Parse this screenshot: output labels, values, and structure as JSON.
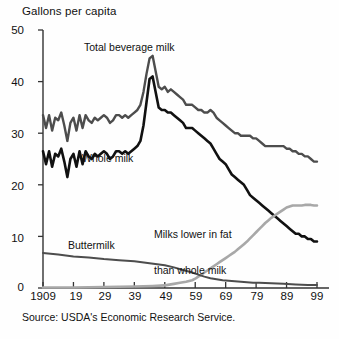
{
  "chart_data": {
    "type": "line",
    "title": "",
    "ylabel": "Gallons per capita",
    "xlabel": "",
    "ylim": [
      0,
      50
    ],
    "xlim": [
      1909,
      1999
    ],
    "yticks": [
      0,
      10,
      20,
      30,
      40,
      50
    ],
    "xticks": [
      1909,
      1919,
      1929,
      1939,
      1949,
      1959,
      1969,
      1979,
      1989,
      1999
    ],
    "xtick_labels": [
      "1909",
      "19",
      "29",
      "39",
      "49",
      "59",
      "69",
      "79",
      "89",
      "99"
    ],
    "grid": false,
    "legend": "inline-annotations",
    "source": "Source:  USDA's Economic Research Service.",
    "annotations": [
      {
        "text": "Total beverage milk",
        "series": "total_beverage_milk"
      },
      {
        "text": "Whole milk",
        "series": "whole_milk"
      },
      {
        "text": "Buttermilk",
        "series": "buttermilk"
      },
      {
        "text": "Milks lower in fat\nthan whole milk",
        "series": "lower_fat_milk"
      }
    ],
    "series": [
      {
        "name": "Total beverage milk",
        "color": "#4d4d4d",
        "x": [
          1909,
          1910,
          1911,
          1912,
          1913,
          1914,
          1915,
          1916,
          1917,
          1918,
          1919,
          1920,
          1921,
          1922,
          1923,
          1924,
          1925,
          1926,
          1927,
          1928,
          1929,
          1930,
          1931,
          1932,
          1933,
          1934,
          1935,
          1936,
          1937,
          1938,
          1939,
          1940,
          1941,
          1942,
          1943,
          1944,
          1945,
          1946,
          1947,
          1948,
          1949,
          1950,
          1951,
          1952,
          1953,
          1954,
          1955,
          1956,
          1957,
          1958,
          1959,
          1960,
          1961,
          1962,
          1963,
          1964,
          1965,
          1966,
          1967,
          1968,
          1969,
          1970,
          1971,
          1972,
          1973,
          1974,
          1975,
          1976,
          1977,
          1978,
          1979,
          1980,
          1981,
          1982,
          1983,
          1984,
          1985,
          1986,
          1987,
          1988,
          1989,
          1990,
          1991,
          1992,
          1993,
          1994,
          1995,
          1996,
          1997,
          1998,
          1999
        ],
        "values": [
          33.5,
          31.0,
          33.5,
          30.5,
          33.0,
          32.5,
          34.0,
          31.5,
          28.5,
          32.0,
          33.0,
          30.5,
          33.5,
          31.0,
          33.5,
          32.5,
          32.0,
          33.0,
          32.5,
          33.0,
          33.5,
          33.0,
          32.0,
          32.5,
          33.5,
          33.5,
          33.0,
          33.5,
          33.0,
          33.5,
          34.0,
          34.5,
          35.5,
          38.0,
          41.5,
          44.5,
          45.0,
          42.0,
          39.0,
          38.5,
          39.0,
          38.0,
          38.5,
          38.0,
          37.5,
          37.0,
          36.5,
          35.5,
          35.5,
          35.5,
          35.0,
          34.5,
          34.5,
          34.0,
          34.0,
          34.5,
          34.0,
          33.0,
          32.5,
          32.0,
          31.5,
          31.0,
          30.5,
          30.0,
          30.0,
          29.5,
          29.5,
          29.5,
          29.5,
          29.0,
          29.0,
          28.5,
          28.0,
          27.5,
          27.5,
          27.5,
          27.5,
          27.5,
          27.5,
          27.5,
          27.0,
          27.0,
          26.5,
          26.5,
          26.0,
          26.0,
          25.5,
          25.5,
          25.0,
          24.5,
          24.5
        ]
      },
      {
        "name": "Whole milk",
        "color": "#111111",
        "x": [
          1909,
          1910,
          1911,
          1912,
          1913,
          1914,
          1915,
          1916,
          1917,
          1918,
          1919,
          1920,
          1921,
          1922,
          1923,
          1924,
          1925,
          1926,
          1927,
          1928,
          1929,
          1930,
          1931,
          1932,
          1933,
          1934,
          1935,
          1936,
          1937,
          1938,
          1939,
          1940,
          1941,
          1942,
          1943,
          1944,
          1945,
          1946,
          1947,
          1948,
          1949,
          1950,
          1951,
          1952,
          1953,
          1954,
          1955,
          1956,
          1957,
          1958,
          1959,
          1960,
          1961,
          1962,
          1963,
          1964,
          1965,
          1966,
          1967,
          1968,
          1969,
          1970,
          1971,
          1972,
          1973,
          1974,
          1975,
          1976,
          1977,
          1978,
          1979,
          1980,
          1981,
          1982,
          1983,
          1984,
          1985,
          1986,
          1987,
          1988,
          1989,
          1990,
          1991,
          1992,
          1993,
          1994,
          1995,
          1996,
          1997,
          1998,
          1999
        ],
        "values": [
          26.5,
          24.0,
          26.5,
          23.5,
          26.0,
          25.5,
          27.0,
          24.5,
          21.5,
          25.0,
          26.0,
          23.5,
          26.5,
          24.0,
          26.5,
          25.5,
          25.0,
          26.0,
          25.5,
          26.0,
          26.5,
          26.0,
          25.0,
          25.5,
          26.5,
          26.5,
          26.0,
          26.5,
          26.0,
          26.5,
          27.0,
          27.5,
          28.5,
          31.5,
          36.0,
          40.5,
          41.0,
          38.0,
          35.0,
          34.5,
          34.5,
          34.0,
          34.0,
          33.5,
          33.0,
          32.5,
          32.0,
          31.0,
          31.0,
          31.0,
          30.5,
          30.0,
          29.5,
          29.0,
          28.5,
          28.0,
          27.0,
          26.0,
          25.0,
          24.5,
          24.0,
          23.0,
          22.0,
          21.5,
          21.0,
          20.5,
          20.0,
          19.0,
          18.0,
          17.5,
          17.0,
          16.5,
          16.0,
          15.5,
          15.0,
          14.5,
          14.0,
          13.5,
          13.0,
          12.5,
          12.0,
          11.5,
          11.0,
          10.5,
          10.5,
          10.0,
          10.0,
          9.5,
          9.5,
          9.0,
          9.0
        ]
      },
      {
        "name": "Milks lower in fat than whole milk",
        "color": "#a8a8a8",
        "x": [
          1909,
          1919,
          1929,
          1939,
          1945,
          1949,
          1950,
          1952,
          1954,
          1956,
          1958,
          1959,
          1960,
          1961,
          1962,
          1963,
          1964,
          1965,
          1966,
          1967,
          1968,
          1969,
          1970,
          1971,
          1972,
          1973,
          1974,
          1975,
          1976,
          1977,
          1978,
          1979,
          1980,
          1981,
          1982,
          1983,
          1984,
          1985,
          1986,
          1987,
          1988,
          1989,
          1990,
          1991,
          1992,
          1993,
          1994,
          1995,
          1996,
          1997,
          1998,
          1999
        ],
        "values": [
          0.1,
          0.1,
          0.2,
          0.3,
          0.4,
          0.5,
          0.6,
          0.8,
          1.0,
          1.2,
          1.5,
          1.8,
          2.2,
          2.6,
          3.0,
          3.4,
          3.8,
          4.2,
          4.6,
          5.0,
          5.4,
          5.8,
          6.2,
          6.6,
          7.0,
          7.5,
          8.0,
          8.5,
          9.0,
          9.6,
          10.2,
          10.8,
          11.4,
          12.0,
          12.6,
          13.1,
          13.6,
          14.0,
          14.4,
          14.8,
          15.2,
          15.6,
          15.8,
          16.0,
          16.0,
          16.0,
          16.0,
          16.1,
          16.1,
          16.1,
          16.0,
          16.0
        ]
      },
      {
        "name": "Buttermilk",
        "color": "#4d4d4d",
        "x": [
          1909,
          1914,
          1919,
          1924,
          1929,
          1934,
          1939,
          1944,
          1949,
          1952,
          1955,
          1958,
          1960,
          1962,
          1964,
          1966,
          1968,
          1970,
          1972,
          1974,
          1976,
          1978,
          1980,
          1984,
          1988,
          1992,
          1996,
          1999
        ],
        "values": [
          6.8,
          6.5,
          6.1,
          5.9,
          5.6,
          5.4,
          5.2,
          4.8,
          4.4,
          4.0,
          3.5,
          3.0,
          2.6,
          2.2,
          1.9,
          1.7,
          1.5,
          1.4,
          1.3,
          1.2,
          1.1,
          1.0,
          1.0,
          0.9,
          0.8,
          0.7,
          0.6,
          0.6
        ]
      }
    ]
  },
  "labels": {
    "y_axis_title": "Gallons per capita",
    "total_beverage": "Total beverage milk",
    "whole_milk": "Whole milk",
    "buttermilk": "Buttermilk",
    "lower_fat_line1": "Milks lower in fat",
    "lower_fat_line2": "than whole milk",
    "source": "Source:  USDA's Economic Research Service.",
    "ytick_0": "0",
    "ytick_10": "10",
    "ytick_20": "20",
    "ytick_30": "30",
    "ytick_40": "40",
    "ytick_50": "50",
    "xtick_1909": "1909",
    "xtick_19": "19",
    "xtick_29": "29",
    "xtick_39": "39",
    "xtick_49": "49",
    "xtick_59": "59",
    "xtick_69": "69",
    "xtick_79": "79",
    "xtick_89": "89",
    "xtick_99": "99"
  },
  "colors": {
    "total_beverage": "#4d4d4d",
    "whole_milk": "#111111",
    "lower_fat": "#a8a8a8",
    "buttermilk": "#4d4d4d",
    "axis": "#333333",
    "background": "#fefefe"
  }
}
